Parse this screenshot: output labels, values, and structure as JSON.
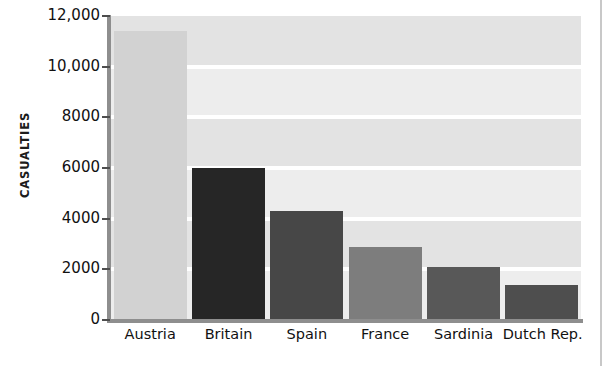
{
  "chart_data": {
    "type": "bar",
    "title": "",
    "subtitle": "",
    "xlabel": "",
    "ylabel": "CASUALTIES",
    "categories": [
      "Austria",
      "Britain",
      "Spain",
      "France",
      "Sardinia",
      "Dutch Rep."
    ],
    "values": [
      11400,
      6000,
      4300,
      2900,
      2100,
      1400
    ],
    "bar_colors": [
      "#d2d2d2",
      "#262626",
      "#474747",
      "#7d7d7d",
      "#585858",
      "#4e4e4e"
    ],
    "ylim": [
      0,
      12000
    ],
    "ytick_labels": [
      "12,000",
      "10,000",
      "8000",
      "6000",
      "4000",
      "2000",
      "0"
    ],
    "ytick_values": [
      12000,
      10000,
      8000,
      6000,
      4000,
      2000,
      0
    ],
    "grid": true,
    "grid_orientation": "horizontal",
    "legend": null,
    "legend_position": "none",
    "plot_background": "#e3e3e3",
    "band_color_light": "#ededed",
    "gridline_color": "#ffffff",
    "axis_color": "#8e8e8e",
    "text_color": "#111111"
  }
}
